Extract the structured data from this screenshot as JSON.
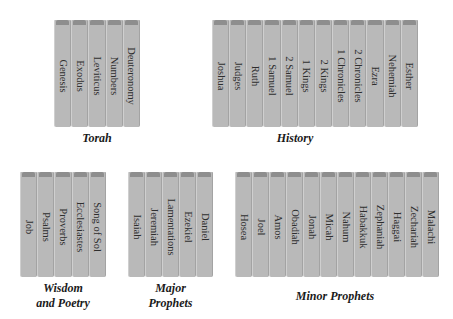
{
  "colors": {
    "book": "#b9b9b9",
    "cap": "#8e8e8e",
    "text": "#2e2e2e",
    "background": "#ffffff"
  },
  "groups": [
    {
      "id": "torah",
      "caption": [
        "Torah"
      ],
      "books": [
        "Genesis",
        "Exodus",
        "Leviticus",
        "Numbers",
        "Deuteronomy"
      ]
    },
    {
      "id": "history",
      "caption": [
        "History"
      ],
      "books": [
        "Joshua",
        "Judges",
        "Ruth",
        "1 Samuel",
        "2 Samuel",
        "1 Kings",
        "2 Kings",
        "1 Chronicles",
        "2 Chronicles",
        "Ezra",
        "Nehemiah",
        "Esther"
      ]
    },
    {
      "id": "wisdom",
      "caption": [
        "Wisdom",
        "and Poetry"
      ],
      "books": [
        "Job",
        "Psalms",
        "Proverbs",
        "Ecclesiastes",
        "Song of Sol"
      ]
    },
    {
      "id": "major",
      "caption": [
        "Major",
        "Prophets"
      ],
      "books": [
        "Isaiah",
        "Jeremiah",
        "Lamentations",
        "Ezekiel",
        "Daniel"
      ]
    },
    {
      "id": "minor",
      "caption": [
        "Minor Prophets"
      ],
      "books": [
        "Hosea",
        "Joel",
        "Amos",
        "Obadiah",
        "Jonah",
        "Micah",
        "Nahum",
        "Habakkuk",
        "Zephaniah",
        "Haggai",
        "Zechariah",
        "Malachi"
      ]
    }
  ]
}
